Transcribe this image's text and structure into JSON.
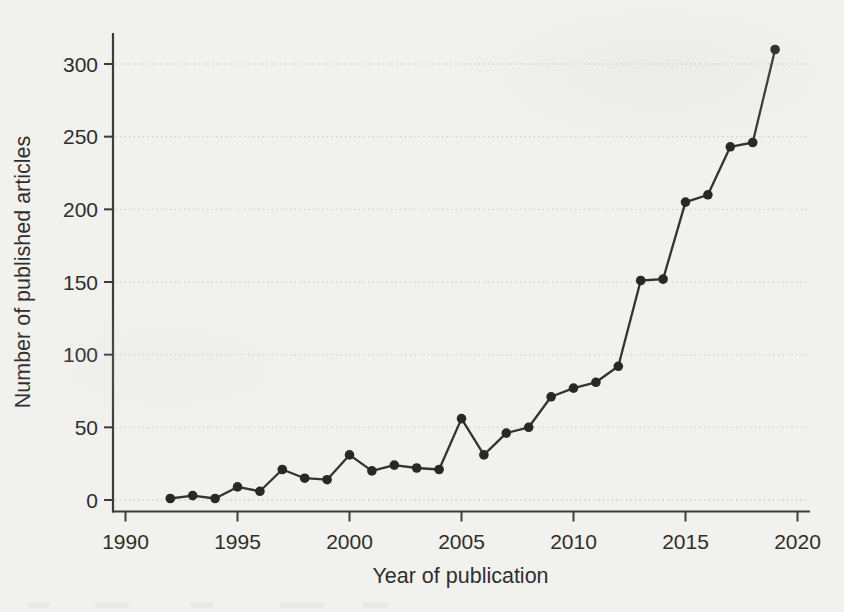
{
  "figure": {
    "background_color": "#f1f1ee"
  },
  "chart_data": {
    "type": "line",
    "title": "",
    "xlabel": "Year of publication",
    "ylabel": "Number of published articles",
    "x": [
      1992,
      1993,
      1994,
      1995,
      1996,
      1997,
      1998,
      1999,
      2000,
      2001,
      2002,
      2003,
      2004,
      2005,
      2006,
      2007,
      2008,
      2009,
      2010,
      2011,
      2012,
      2013,
      2014,
      2015,
      2016,
      2017,
      2018,
      2019
    ],
    "values": [
      1,
      3,
      1,
      9,
      6,
      21,
      15,
      14,
      31,
      20,
      24,
      22,
      21,
      56,
      31,
      46,
      50,
      71,
      77,
      81,
      92,
      151,
      152,
      205,
      210,
      243,
      246,
      310
    ],
    "x_ticks": [
      1990,
      1995,
      2000,
      2005,
      2010,
      2015,
      2020
    ],
    "y_ticks": [
      0,
      50,
      100,
      150,
      200,
      250,
      300
    ],
    "xlim": [
      1990,
      2020
    ],
    "ylim": [
      0,
      318
    ],
    "grid": "horizontal-dotted",
    "legend_position": "none",
    "marker": "filled-circle",
    "colors": {
      "line": "#333333",
      "marker": "#282828",
      "grid": "#d4d4cf",
      "axis": "#3c3c3c",
      "text": "#2e2e2e"
    }
  }
}
